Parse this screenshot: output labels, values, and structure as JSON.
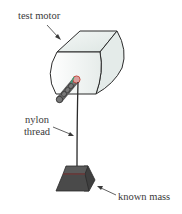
{
  "diagram": {
    "labels": {
      "motor": "test motor",
      "thread_line1": "nylon",
      "thread_line2": "thread",
      "mass": "known mass"
    },
    "components": [
      "test-motor",
      "motor-shaft",
      "nylon-thread",
      "known-mass"
    ],
    "colors": {
      "outline": "#2b2b2b",
      "motor_fill": "#eef2f1",
      "shaft": "#6b6b6b",
      "mass": "#4a4a4a",
      "mass_top": "#5a5a5a",
      "accent_red": "#c0392b",
      "accent_green": "#3aa57a"
    }
  }
}
